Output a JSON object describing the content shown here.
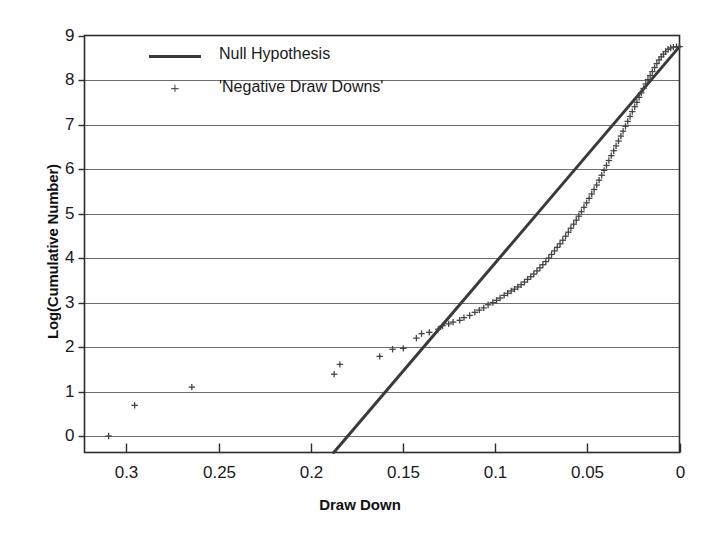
{
  "chart_data": {
    "type": "scatter",
    "title": "",
    "xlabel": "Draw Down",
    "ylabel": "Log(Cumulative Number)",
    "xlim": [
      0.3227,
      0.0
    ],
    "ylim": [
      -0.37,
      9.0
    ],
    "x_reversed": true,
    "grid": "horizontal",
    "xticks": [
      "0.3",
      "0.25",
      "0.2",
      "0.15",
      "0.1",
      "0.05",
      "0"
    ],
    "xtick_values": [
      0.3,
      0.25,
      0.2,
      0.15,
      0.1,
      0.05,
      0
    ],
    "yticks": [
      "0",
      "1",
      "2",
      "3",
      "4",
      "5",
      "6",
      "7",
      "8",
      "9"
    ],
    "ytick_values": [
      0,
      1,
      2,
      3,
      4,
      5,
      6,
      7,
      8,
      9
    ],
    "legend_position": "top-left",
    "series": [
      {
        "name": "Null Hypothesis",
        "type": "line",
        "color": "#3a3a3a",
        "x": [
          0.1875,
          0.0
        ],
        "y": [
          -0.37,
          8.75
        ]
      },
      {
        "name": "'Negative Draw Downs'",
        "type": "scatter",
        "marker": "+",
        "color": "#444444",
        "points": [
          [
            0.3096,
            0.0
          ],
          [
            0.2955,
            0.69
          ],
          [
            0.2645,
            1.1
          ],
          [
            0.1873,
            1.39
          ],
          [
            0.1842,
            1.61
          ],
          [
            0.1626,
            1.79
          ],
          [
            0.1556,
            1.95
          ],
          [
            0.1498,
            1.97
          ],
          [
            0.1427,
            2.2
          ],
          [
            0.1399,
            2.3
          ],
          [
            0.1357,
            2.33
          ],
          [
            0.1308,
            2.4
          ],
          [
            0.1285,
            2.48
          ],
          [
            0.1252,
            2.52
          ],
          [
            0.1228,
            2.56
          ],
          [
            0.1192,
            2.6
          ],
          [
            0.1169,
            2.66
          ],
          [
            0.1138,
            2.71
          ],
          [
            0.111,
            2.78
          ],
          [
            0.1086,
            2.83
          ],
          [
            0.1062,
            2.88
          ],
          [
            0.1038,
            2.95
          ],
          [
            0.1012,
            3.0
          ],
          [
            0.0992,
            3.05
          ],
          [
            0.0973,
            3.1
          ],
          [
            0.0951,
            3.16
          ],
          [
            0.0932,
            3.21
          ],
          [
            0.0913,
            3.26
          ],
          [
            0.0895,
            3.3
          ],
          [
            0.0877,
            3.35
          ],
          [
            0.0859,
            3.4
          ],
          [
            0.0841,
            3.46
          ],
          [
            0.0824,
            3.52
          ],
          [
            0.0807,
            3.58
          ],
          [
            0.079,
            3.64
          ],
          [
            0.0773,
            3.71
          ],
          [
            0.0757,
            3.78
          ],
          [
            0.0741,
            3.85
          ],
          [
            0.0725,
            3.92
          ],
          [
            0.0709,
            4.0
          ],
          [
            0.0694,
            4.08
          ],
          [
            0.0678,
            4.16
          ],
          [
            0.0663,
            4.24
          ],
          [
            0.0648,
            4.32
          ],
          [
            0.0633,
            4.4
          ],
          [
            0.0618,
            4.49
          ],
          [
            0.0603,
            4.58
          ],
          [
            0.0589,
            4.67
          ],
          [
            0.0574,
            4.76
          ],
          [
            0.056,
            4.85
          ],
          [
            0.0546,
            4.94
          ],
          [
            0.0532,
            5.04
          ],
          [
            0.0518,
            5.14
          ],
          [
            0.0504,
            5.24
          ],
          [
            0.049,
            5.34
          ],
          [
            0.0476,
            5.44
          ],
          [
            0.0463,
            5.54
          ],
          [
            0.0449,
            5.64
          ],
          [
            0.0436,
            5.75
          ],
          [
            0.0422,
            5.86
          ],
          [
            0.0409,
            5.97
          ],
          [
            0.0396,
            6.08
          ],
          [
            0.0383,
            6.19
          ],
          [
            0.037,
            6.3
          ],
          [
            0.0357,
            6.41
          ],
          [
            0.0344,
            6.52
          ],
          [
            0.0331,
            6.63
          ],
          [
            0.0318,
            6.74
          ],
          [
            0.0306,
            6.85
          ],
          [
            0.0293,
            6.96
          ],
          [
            0.0281,
            7.07
          ],
          [
            0.0268,
            7.18
          ],
          [
            0.0256,
            7.29
          ],
          [
            0.0243,
            7.4
          ],
          [
            0.0231,
            7.5
          ],
          [
            0.0219,
            7.61
          ],
          [
            0.0207,
            7.71
          ],
          [
            0.0195,
            7.81
          ],
          [
            0.0183,
            7.91
          ],
          [
            0.0171,
            8.01
          ],
          [
            0.0159,
            8.1
          ],
          [
            0.0147,
            8.19
          ],
          [
            0.0135,
            8.28
          ],
          [
            0.0123,
            8.37
          ],
          [
            0.0111,
            8.45
          ],
          [
            0.0099,
            8.52
          ],
          [
            0.0087,
            8.58
          ],
          [
            0.0075,
            8.64
          ],
          [
            0.0062,
            8.69
          ],
          [
            0.0048,
            8.72
          ],
          [
            0.0033,
            8.74
          ],
          [
            0.0016,
            8.75
          ],
          [
            0.0,
            8.75
          ]
        ]
      }
    ]
  },
  "legend": {
    "line_label": "Null Hypothesis",
    "points_label": "'Negative Draw Downs'",
    "points_marker": "+"
  },
  "axes": {
    "x_title": "Draw Down",
    "y_title": "Log(Cumulative Number)"
  },
  "colors": {
    "line": "#3a3a3a",
    "points": "#444444",
    "grid": "#6e6e6e",
    "frame": "#2b2b2b",
    "text": "#1a1a1a",
    "background": "#ffffff"
  }
}
